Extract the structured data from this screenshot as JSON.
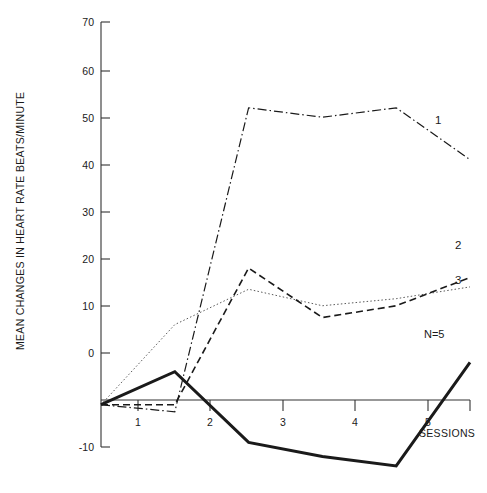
{
  "chart_data": {
    "type": "line",
    "title": "",
    "xlabel": "SESSIONS",
    "ylabel": "MEAN CHANGES IN HEART RATE  BEATS/MINUTE",
    "x": [
      0,
      1,
      2,
      3,
      4,
      5
    ],
    "categories": [
      "",
      "1",
      "2",
      "3",
      "4",
      "5"
    ],
    "xtick_labels": [
      "1",
      "2",
      "3",
      "4",
      "5"
    ],
    "xtick_values": [
      1,
      2,
      3,
      4,
      5
    ],
    "ytick_labels": [
      "-10",
      "0",
      "10",
      "20",
      "30",
      "40",
      "50",
      "60",
      "70"
    ],
    "ytick_values": [
      -10,
      0,
      10,
      20,
      30,
      40,
      50,
      60,
      70
    ],
    "xlim": [
      0,
      5
    ],
    "ylim": [
      -10,
      70
    ],
    "grid": false,
    "legend_position": "right-of-line-ends",
    "annotations": [
      {
        "text": "N=5",
        "x": 4.55,
        "y": 9
      }
    ],
    "series": [
      {
        "name": "1",
        "label": "1",
        "style": "dash-dot",
        "color": "#1a1a1a",
        "values": [
          -1,
          -2.5,
          62,
          60,
          62,
          51
        ]
      },
      {
        "name": "2",
        "label": "2",
        "style": "dashed",
        "color": "#1a1a1a",
        "values": [
          -1,
          -1,
          28,
          17.5,
          20,
          26
        ]
      },
      {
        "name": "3",
        "label": "3",
        "style": "dotted",
        "color": "#5a5a5a",
        "values": [
          -1,
          16,
          23.5,
          20,
          21.5,
          24
        ]
      },
      {
        "name": "4",
        "label": "",
        "style": "solid-bold",
        "color": "#1a1a1a",
        "values": [
          -1,
          6,
          -9,
          -12,
          -14,
          8
        ]
      }
    ]
  },
  "labels": {
    "series1": "1",
    "series2": "2",
    "series3": "3",
    "note_n": "N=5",
    "xaxis_title": "SESSIONS",
    "yaxis_title": "MEAN CHANGES IN HEART RATE  BEATS/MINUTE"
  },
  "ticks": {
    "y": [
      "70",
      "60",
      "50",
      "40",
      "30",
      "20",
      "10",
      "0",
      "-10"
    ],
    "x": [
      "1",
      "2",
      "3",
      "4",
      "5"
    ]
  }
}
